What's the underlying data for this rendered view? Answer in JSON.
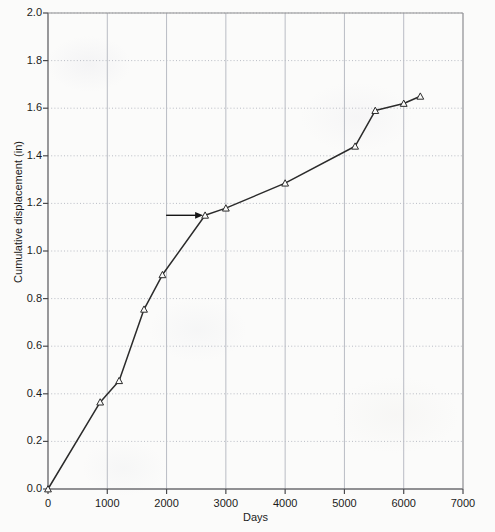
{
  "figure": {
    "background_color": "#fbfbfa",
    "ink_color": "#2b2b2b",
    "grid_color": "#b9bcc4"
  },
  "axis": {
    "x_title": "Days",
    "y_title": "Cumulative displacement (in)",
    "x_ticks": [
      "0",
      "1000",
      "2000",
      "3000",
      "4000",
      "5000",
      "6000",
      "7000"
    ],
    "y_ticks": [
      "0.0",
      "0.2",
      "0.4",
      "0.6",
      "0.8",
      "1.0",
      "1.2",
      "1.4",
      "1.6",
      "1.8",
      "2.0"
    ]
  },
  "annotation": {
    "arrow_name": "right-pointing-arrow",
    "arrow_target_x": 2650,
    "arrow_target_y": 1.15
  },
  "chart_data": {
    "type": "line",
    "title": "",
    "subtitle": "",
    "xlabel": "Days",
    "ylabel": "Cumulative displacement (in)",
    "xlim": [
      0,
      7000
    ],
    "ylim": [
      0,
      2.0
    ],
    "xticks": [
      0,
      1000,
      2000,
      3000,
      4000,
      5000,
      6000,
      7000
    ],
    "yticks": [
      0.0,
      0.2,
      0.4,
      0.6,
      0.8,
      1.0,
      1.2,
      1.4,
      1.6,
      1.8,
      2.0
    ],
    "grid": true,
    "grid_style": {
      "x": "solid",
      "y": "dotted"
    },
    "legend": false,
    "legend_position": "none",
    "marker": "open-triangle",
    "line_color": "#2b2b2b",
    "x": [
      0,
      880,
      1200,
      1620,
      1930,
      2650,
      3000,
      4000,
      5180,
      5520,
      6000,
      6280
    ],
    "y": [
      0.0,
      0.365,
      0.455,
      0.755,
      0.9,
      1.15,
      1.18,
      1.285,
      1.44,
      1.59,
      1.62,
      1.65
    ],
    "series": [
      {
        "name": "Cumulative displacement",
        "points": [
          {
            "x": 0,
            "y": 0.0
          },
          {
            "x": 880,
            "y": 0.365
          },
          {
            "x": 1200,
            "y": 0.455
          },
          {
            "x": 1620,
            "y": 0.755
          },
          {
            "x": 1930,
            "y": 0.9
          },
          {
            "x": 2650,
            "y": 1.15
          },
          {
            "x": 3000,
            "y": 1.18
          },
          {
            "x": 4000,
            "y": 1.285
          },
          {
            "x": 5180,
            "y": 1.44
          },
          {
            "x": 5520,
            "y": 1.59
          },
          {
            "x": 6000,
            "y": 1.62
          },
          {
            "x": 6280,
            "y": 1.65
          }
        ]
      }
    ],
    "annotations": [
      {
        "type": "arrow",
        "text": "",
        "x": 2650,
        "y": 1.15,
        "direction": "right"
      }
    ]
  }
}
